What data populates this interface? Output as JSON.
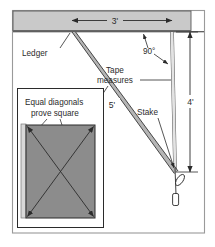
{
  "figure": {
    "labels": {
      "ledger": "Ledger",
      "tape_measures_line1": "Tape",
      "tape_measures_line2": "measures",
      "stake": "Stake",
      "angle": "90°",
      "inset_line1": "Equal diagonals",
      "inset_line2": "prove square"
    },
    "dimensions": {
      "top_run": "3'",
      "hypotenuse": "5'",
      "vertical_rise": "4'"
    },
    "colors": {
      "line": "#2b2b2b",
      "frame": "#9a9a9a",
      "ledger_fill": "#c9c9c9",
      "tape_fill": "#b5b5b5",
      "inset_panel_fill": "#8c8c8c",
      "inset_strip_fill": "#d8d8d8",
      "background": "#ffffff"
    }
  }
}
